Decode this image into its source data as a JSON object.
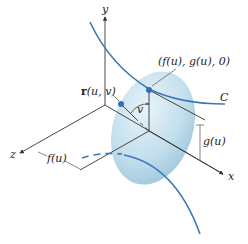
{
  "diagram": {
    "axes": {
      "x": "x",
      "y": "y",
      "z": "z"
    },
    "curve_label": "C",
    "point_label": "(f(u), g(u), 0)",
    "surface_point_label_bold": "r",
    "surface_point_label_rest": "(u, v)",
    "angle_label": "v",
    "height_label": "g(u)",
    "depth_label": "f(u)",
    "colors": {
      "curve": "#3a78b8",
      "ellipse_fill": "#a9cde0",
      "point": "#2f6fb5",
      "axis": "#333333"
    }
  }
}
